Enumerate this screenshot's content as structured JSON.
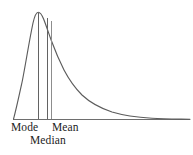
{
  "figure": {
    "name": "skewed-distribution-central-tendency",
    "background_color": "#ffffff",
    "width": 193,
    "height": 155
  },
  "labels": {
    "mode": "Mode",
    "median": "Median",
    "mean": "Mean"
  },
  "colors": {
    "curve": "#5c5c5c",
    "axis": "#6e6e6e",
    "marker": "#636363",
    "marker_soft": "#8d8d8d",
    "text": "#1c1c1c"
  },
  "chart_data": {
    "type": "line",
    "title": "",
    "subtitle": "",
    "xlabel": "",
    "ylabel": "",
    "grid": false,
    "legend": "none",
    "axis": {
      "baseline_y_px": 119,
      "x_start_px": 13,
      "x_end_px": 190,
      "show_y_axis": false,
      "show_x_axis": true,
      "tick_labels": [
        "Mode",
        "Median",
        "Mean"
      ]
    },
    "skew": "right",
    "peak": {
      "x_px": 38,
      "y_px": 12
    },
    "annotations": [
      {
        "label": "Mode",
        "x_px": 38.0,
        "line_top_y_px": 12.5,
        "line_bottom_y_px": 119,
        "text_x_px": 11,
        "text_y_px": 121
      },
      {
        "label": "Median",
        "x_px": 47.0,
        "line_top_y_px": 17.5,
        "line_bottom_y_px": 119,
        "text_x_px": 30,
        "text_y_px": 134
      },
      {
        "label": "Mean",
        "x_px": 50.5,
        "line_top_y_px": 21.0,
        "line_bottom_y_px": 119,
        "text_x_px": 52,
        "text_y_px": 121
      }
    ],
    "x": [
      13,
      16,
      19,
      22,
      25,
      28,
      31,
      34,
      38,
      42,
      47,
      51,
      56,
      62,
      68,
      76,
      85,
      95,
      106,
      118,
      130,
      143,
      157,
      170,
      182,
      190
    ],
    "y": [
      119,
      110,
      98,
      82,
      64,
      46,
      31,
      20,
      12,
      13,
      18,
      23,
      31,
      42,
      52,
      64,
      76,
      86,
      95,
      102,
      108,
      112,
      115,
      117,
      118,
      119
    ],
    "series": [
      {
        "name": "density",
        "x": [
          13,
          16,
          19,
          22,
          25,
          28,
          31,
          34,
          38,
          42,
          47,
          51,
          56,
          62,
          68,
          76,
          85,
          95,
          106,
          118,
          130,
          143,
          157,
          170,
          182,
          190
        ],
        "values": [
          119,
          110,
          98,
          82,
          64,
          46,
          31,
          20,
          12,
          13,
          18,
          23,
          31,
          42,
          52,
          64,
          76,
          86,
          95,
          102,
          108,
          112,
          115,
          117,
          118,
          119
        ]
      }
    ],
    "path_d": "M 13.5,119 C 16,110 19,96 22.5,80 C 26,62 29,42 33,23 C 34.6,16 36.4,12.2 38.2,12.2 C 40.2,12.2 42,15 43.6,19 C 46,25 48.6,33 51.5,41 C 55,50.5 59,60 64,70 C 69,79.5 75,88 82,95 C 90,102.5 100,108 112,112 C 124,115.6 138,117.4 152,118.3 C 164,119 178,119 190,119.2",
    "ylim": [
      0,
      119
    ],
    "xlim": [
      13,
      190
    ]
  }
}
